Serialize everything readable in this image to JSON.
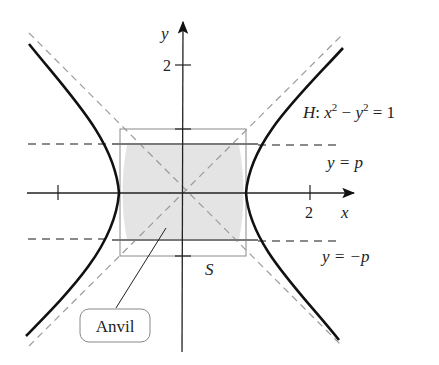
{
  "diagram": {
    "axes": {
      "x_label": "x",
      "y_label": "y",
      "x_tick_label": "2",
      "y_tick_label": "2"
    },
    "curve_label": {
      "prefix": "H",
      "text": "H: x² − y² = 1"
    },
    "lines": {
      "upper": "y = p",
      "lower": "y = −p"
    },
    "square_label": "S",
    "callout": "Anvil",
    "colors": {
      "curve": "#111111",
      "asymptote": "#999999",
      "band_line": "#888888",
      "shade": "#e6e6e6",
      "square": "#888888"
    }
  }
}
